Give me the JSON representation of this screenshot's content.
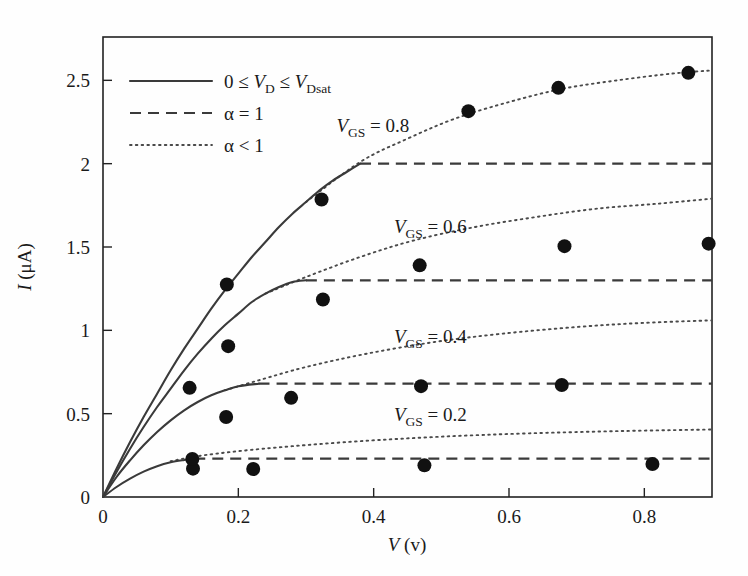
{
  "chart_data": {
    "type": "line",
    "title": "",
    "xlabel": "V (v)",
    "ylabel": "I (μA)",
    "xlabel_symbol": "V",
    "xlabel_unit": "(v)",
    "ylabel_symbol": "I",
    "ylabel_unit": "(μA)",
    "xlim": [
      0,
      0.9
    ],
    "ylim": [
      0,
      2.76
    ],
    "xticks": [
      0,
      0.2,
      0.4,
      0.6,
      0.8
    ],
    "xticklabels": [
      "0",
      "0.2",
      "0.4",
      "0.6",
      "0.8"
    ],
    "yticks": [
      0,
      0.5,
      1,
      1.5,
      2,
      2.5
    ],
    "yticklabels": [
      "0",
      "0.5",
      "1",
      "1.5",
      "2",
      "2.5"
    ],
    "grid": false,
    "legend_position": "upper-left-inside",
    "legend": [
      {
        "style": "solid",
        "label_plain": "0 ≤ V_D ≤ V_Dsat",
        "prefix": "0 ≤ ",
        "sym1": "V",
        "sub1": "D",
        "mid": " ≤ ",
        "sym2": "V",
        "sub2": "Dsat"
      },
      {
        "style": "dashed",
        "label_plain": "α = 1",
        "text": "α = 1"
      },
      {
        "style": "dotted",
        "label_plain": "α < 1",
        "text": "α < 1"
      }
    ],
    "annotations": [
      {
        "name": "vgs-08",
        "sym": "V",
        "sub": "GS",
        "eq": " = 0.8",
        "x": 0.345,
        "y": 2.19
      },
      {
        "name": "vgs-06",
        "sym": "V",
        "sub": "GS",
        "eq": " = 0.6",
        "x": 0.43,
        "y": 1.585
      },
      {
        "name": "vgs-04",
        "sym": "V",
        "sub": "GS",
        "eq": " = 0.4",
        "x": 0.43,
        "y": 0.925
      },
      {
        "name": "vgs-02",
        "sym": "V",
        "sub": "GS",
        "eq": " = 0.2",
        "x": 0.43,
        "y": 0.455
      }
    ],
    "series": [
      {
        "name": "V_GS = 0.8",
        "vgs": 0.8,
        "i_sat": 2.0,
        "v_dsat": 0.38,
        "triode_points": [
          [
            0,
            0
          ],
          [
            0.02,
            0.17
          ],
          [
            0.04,
            0.33
          ],
          [
            0.06,
            0.48
          ],
          [
            0.08,
            0.62
          ],
          [
            0.1,
            0.76
          ],
          [
            0.12,
            0.89
          ],
          [
            0.14,
            1.01
          ],
          [
            0.16,
            1.13
          ],
          [
            0.18,
            1.24
          ],
          [
            0.2,
            1.34
          ],
          [
            0.22,
            1.44
          ],
          [
            0.24,
            1.53
          ],
          [
            0.26,
            1.62
          ],
          [
            0.28,
            1.7
          ],
          [
            0.3,
            1.77
          ],
          [
            0.32,
            1.84
          ],
          [
            0.34,
            1.9
          ],
          [
            0.36,
            1.95
          ],
          [
            0.38,
            2.0
          ]
        ],
        "saturation_points": [
          [
            0.38,
            2.0
          ],
          [
            0.9,
            2.0
          ]
        ],
        "alpha_points": [
          [
            0.3,
            1.77
          ],
          [
            0.38,
            2.01
          ],
          [
            0.45,
            2.15
          ],
          [
            0.52,
            2.27
          ],
          [
            0.6,
            2.37
          ],
          [
            0.68,
            2.45
          ],
          [
            0.76,
            2.5
          ],
          [
            0.84,
            2.54
          ],
          [
            0.9,
            2.56
          ]
        ]
      },
      {
        "name": "V_GS = 0.6",
        "vgs": 0.6,
        "i_sat": 1.3,
        "v_dsat": 0.3,
        "triode_points": [
          [
            0,
            0
          ],
          [
            0.02,
            0.15
          ],
          [
            0.04,
            0.29
          ],
          [
            0.06,
            0.42
          ],
          [
            0.08,
            0.54
          ],
          [
            0.1,
            0.65
          ],
          [
            0.12,
            0.76
          ],
          [
            0.14,
            0.86
          ],
          [
            0.16,
            0.95
          ],
          [
            0.18,
            1.03
          ],
          [
            0.2,
            1.1
          ],
          [
            0.22,
            1.17
          ],
          [
            0.24,
            1.22
          ],
          [
            0.26,
            1.26
          ],
          [
            0.28,
            1.29
          ],
          [
            0.3,
            1.3
          ]
        ],
        "saturation_points": [
          [
            0.3,
            1.3
          ],
          [
            0.9,
            1.3
          ]
        ],
        "alpha_points": [
          [
            0.24,
            1.22
          ],
          [
            0.3,
            1.32
          ],
          [
            0.38,
            1.44
          ],
          [
            0.46,
            1.54
          ],
          [
            0.55,
            1.62
          ],
          [
            0.64,
            1.68
          ],
          [
            0.73,
            1.73
          ],
          [
            0.82,
            1.76
          ],
          [
            0.9,
            1.79
          ]
        ]
      },
      {
        "name": "V_GS = 0.4",
        "vgs": 0.4,
        "i_sat": 0.68,
        "v_dsat": 0.23,
        "triode_points": [
          [
            0,
            0
          ],
          [
            0.02,
            0.12
          ],
          [
            0.04,
            0.22
          ],
          [
            0.06,
            0.31
          ],
          [
            0.08,
            0.39
          ],
          [
            0.1,
            0.46
          ],
          [
            0.12,
            0.52
          ],
          [
            0.14,
            0.57
          ],
          [
            0.16,
            0.61
          ],
          [
            0.18,
            0.64
          ],
          [
            0.2,
            0.665
          ],
          [
            0.23,
            0.68
          ]
        ],
        "saturation_points": [
          [
            0.23,
            0.68
          ],
          [
            0.9,
            0.68
          ]
        ],
        "alpha_points": [
          [
            0.18,
            0.64
          ],
          [
            0.23,
            0.7
          ],
          [
            0.3,
            0.78
          ],
          [
            0.39,
            0.86
          ],
          [
            0.49,
            0.93
          ],
          [
            0.59,
            0.98
          ],
          [
            0.7,
            1.02
          ],
          [
            0.8,
            1.045
          ],
          [
            0.9,
            1.06
          ]
        ]
      },
      {
        "name": "V_GS = 0.2",
        "vgs": 0.2,
        "i_sat": 0.23,
        "v_dsat": 0.135,
        "triode_points": [
          [
            0,
            0
          ],
          [
            0.02,
            0.06
          ],
          [
            0.04,
            0.11
          ],
          [
            0.06,
            0.152
          ],
          [
            0.08,
            0.185
          ],
          [
            0.1,
            0.208
          ],
          [
            0.12,
            0.222
          ],
          [
            0.135,
            0.23
          ]
        ],
        "saturation_points": [
          [
            0.135,
            0.23
          ],
          [
            0.9,
            0.23
          ]
        ],
        "alpha_points": [
          [
            0.1,
            0.215
          ],
          [
            0.14,
            0.245
          ],
          [
            0.2,
            0.275
          ],
          [
            0.28,
            0.305
          ],
          [
            0.38,
            0.335
          ],
          [
            0.5,
            0.362
          ],
          [
            0.63,
            0.382
          ],
          [
            0.77,
            0.396
          ],
          [
            0.9,
            0.405
          ]
        ]
      }
    ],
    "scatter_points": [
      [
        0.128,
        0.655
      ],
      [
        0.183,
        1.275
      ],
      [
        0.323,
        1.785
      ],
      [
        0.54,
        2.315
      ],
      [
        0.673,
        2.455
      ],
      [
        0.865,
        2.545
      ],
      [
        0.185,
        0.905
      ],
      [
        0.278,
        0.595
      ],
      [
        0.325,
        1.185
      ],
      [
        0.468,
        1.39
      ],
      [
        0.682,
        1.505
      ],
      [
        0.895,
        1.52
      ],
      [
        0.133,
        0.17
      ],
      [
        0.182,
        0.48
      ],
      [
        0.222,
        0.168
      ],
      [
        0.47,
        0.665
      ],
      [
        0.678,
        0.672
      ],
      [
        0.132,
        0.228
      ],
      [
        0.475,
        0.19
      ],
      [
        0.812,
        0.198
      ]
    ],
    "scatter_marker": {
      "shape": "circle",
      "size_px": 7,
      "color": "#111111"
    }
  },
  "colors": {
    "background": "#fefefe",
    "axis": "#222222",
    "solid_curve": "#3a3a3a",
    "dashed_curve": "#3a3a3a",
    "dotted_curve": "#4a4a4a",
    "marker": "#111111"
  }
}
